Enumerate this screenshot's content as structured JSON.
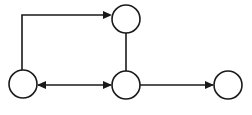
{
  "diagram": {
    "title": "Directed graph with four nodes",
    "type": "directed-graph",
    "canvas": {
      "width": 252,
      "height": 115
    },
    "style": {
      "background_color": "#ffffff",
      "stroke_color": "#1a1a1a",
      "node_fill_color": "#ffffff",
      "stroke_width": 1.6,
      "node_radius": 14
    },
    "nodes": [
      {
        "id": "top",
        "label": "",
        "cx": 126,
        "cy": 19,
        "r": 14
      },
      {
        "id": "left",
        "label": "",
        "cx": 23,
        "cy": 84,
        "r": 14
      },
      {
        "id": "middle",
        "label": "",
        "cx": 126,
        "cy": 85,
        "r": 14
      },
      {
        "id": "right",
        "label": "",
        "cx": 228,
        "cy": 85,
        "r": 14
      }
    ],
    "edges": [
      {
        "id": "left-to-top",
        "from": "left",
        "to": "top",
        "shape": "elbow",
        "direction": "forward",
        "arrowheads": [
          "end"
        ],
        "path": "M 22 70 L 22 15 L 110 15"
      },
      {
        "id": "top-to-middle",
        "from": "top",
        "to": "middle",
        "shape": "straight",
        "direction": "none",
        "arrowheads": [],
        "path": "M 126 33 L 126 71"
      },
      {
        "id": "left-middle-bidirectional",
        "from": "left",
        "to": "middle",
        "shape": "straight",
        "direction": "bidirectional",
        "arrowheads": [
          "start",
          "end"
        ],
        "path": "M 38 85 L 111 85"
      },
      {
        "id": "middle-to-right",
        "from": "middle",
        "to": "right",
        "shape": "straight",
        "direction": "forward",
        "arrowheads": [
          "end"
        ],
        "path": "M 140 85 L 213 85"
      }
    ]
  }
}
